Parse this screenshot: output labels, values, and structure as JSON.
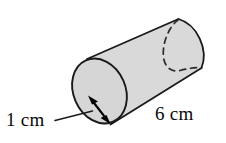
{
  "figure": {
    "name": "cylinder-diagram",
    "shape": "cylinder",
    "colors": {
      "background": "#ffffff",
      "body_fill": "#d9d9d9",
      "face_fill": "#d6d6d6",
      "outline": "#1a1a1a",
      "hidden_edge": "#2a2a2a",
      "label_text": "#0a0a0a",
      "arrow": "#000000"
    },
    "labels": {
      "radius": "1 cm",
      "height": "6 cm"
    },
    "annotations": {
      "radius_arrow": "double-headed-arrow",
      "hidden_edge_style": "dashed",
      "leader_line": "line from radius label to radius arrow"
    }
  },
  "measurements": {
    "radius_value": "1",
    "radius_unit": "cm",
    "length_value": "6",
    "length_unit": "cm"
  }
}
